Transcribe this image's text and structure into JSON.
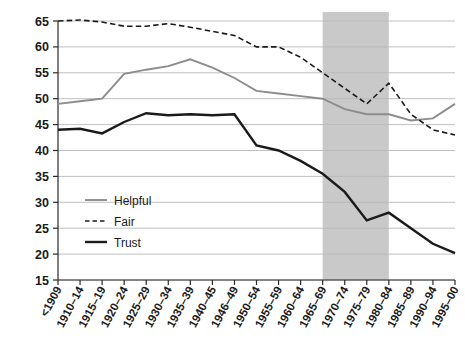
{
  "chart_data": {
    "type": "line",
    "title": "",
    "subtitle": "",
    "xlabel": "",
    "ylabel": "",
    "ylim": [
      15,
      65
    ],
    "yticks": [
      15,
      20,
      25,
      30,
      35,
      40,
      45,
      50,
      55,
      60,
      65
    ],
    "grid": true,
    "legend_position": "inside-left",
    "categories": [
      "<1909",
      "1910–14",
      "1915–19",
      "1920–24",
      "1925–29",
      "1930–34",
      "1935–39",
      "1940–45",
      "1946–49",
      "1950–54",
      "1955–59",
      "1960–64",
      "1965–69",
      "1970–74",
      "1975–79",
      "1980–84",
      "1985–89",
      "1990–94",
      "1995–00"
    ],
    "series": [
      {
        "name": "Helpful",
        "style": "solid",
        "color": "#8c8c8c",
        "width": 1.9,
        "values": [
          49.0,
          49.5,
          50.0,
          54.8,
          55.6,
          56.3,
          57.6,
          56.0,
          54.0,
          51.5,
          51.0,
          50.5,
          50.0,
          48.0,
          47.0,
          47.0,
          45.8,
          46.2,
          49.0
        ]
      },
      {
        "name": "Fair",
        "style": "dashed",
        "color": "#1a1a1a",
        "width": 1.6,
        "values": [
          65.0,
          65.2,
          64.8,
          64.0,
          64.0,
          64.5,
          63.8,
          63.0,
          62.2,
          60.0,
          60.0,
          58.0,
          55.0,
          52.0,
          49.0,
          53.0,
          47.0,
          44.0,
          43.0
        ]
      },
      {
        "name": "Trust",
        "style": "solid",
        "color": "#1a1a1a",
        "width": 2.4,
        "values": [
          44.0,
          44.2,
          43.3,
          45.5,
          47.2,
          46.8,
          47.0,
          46.8,
          47.0,
          41.0,
          40.0,
          38.0,
          35.5,
          32.0,
          26.5,
          28.0,
          25.0,
          22.0,
          20.2
        ]
      }
    ],
    "shaded_band": {
      "from_category": "1965–69",
      "to_category": "1980–84",
      "color": "#c9c9c9"
    }
  },
  "legend": {
    "entries": [
      {
        "label": "Helpful"
      },
      {
        "label": "Fair"
      },
      {
        "label": "Trust"
      }
    ]
  }
}
